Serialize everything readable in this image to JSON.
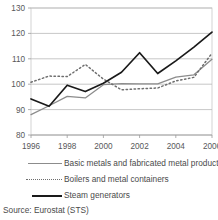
{
  "source_note": "Source: Eurostat (STS)",
  "legend": {
    "items": [
      {
        "label": "Basic metals and fabricated metal products",
        "key": "solid-grey",
        "color": "#8c8c8c"
      },
      {
        "label": "Boilers and metal containers",
        "key": "dotted",
        "color": "#6e6e6e"
      },
      {
        "label": "Steam generators",
        "key": "solid-black",
        "color": "#1a1a1a"
      }
    ]
  },
  "chart_data": {
    "type": "line",
    "title": "",
    "xlabel": "",
    "ylabel": "",
    "x": [
      1996,
      1997,
      1998,
      1999,
      2000,
      2001,
      2002,
      2003,
      2004,
      2005,
      2006
    ],
    "xticks": [
      1996,
      1998,
      2000,
      2002,
      2004,
      2006
    ],
    "xticklabels": [
      "1996",
      "1998",
      "2000",
      "2002",
      "2004",
      "2006"
    ],
    "xlim": [
      1996,
      2006
    ],
    "ylim": [
      80,
      130
    ],
    "yticks": [
      80,
      90,
      100,
      110,
      120,
      130
    ],
    "yticklabels": [
      "80",
      "90",
      "100",
      "110",
      "120",
      "130"
    ],
    "grid": true,
    "legend_position": "below",
    "series": [
      {
        "name": "Basic metals and fabricated metal products",
        "color": "#8c8c8c",
        "style": "solid",
        "values": [
          88.0,
          91.5,
          95.2,
          94.6,
          99.8,
          100.2,
          100.1,
          100.1,
          102.8,
          103.7,
          109.8
        ]
      },
      {
        "name": "Boilers and metal containers",
        "color": "#6e6e6e",
        "style": "dotted",
        "values": [
          100.8,
          103.2,
          103.0,
          107.8,
          102.0,
          97.8,
          98.2,
          98.5,
          101.3,
          102.7,
          112.2
        ]
      },
      {
        "name": "Steam generators",
        "color": "#1a1a1a",
        "style": "solid",
        "values": [
          94.2,
          91.3,
          99.6,
          97.1,
          100.4,
          104.7,
          112.4,
          104.2,
          109.2,
          114.6,
          120.5
        ]
      }
    ]
  }
}
